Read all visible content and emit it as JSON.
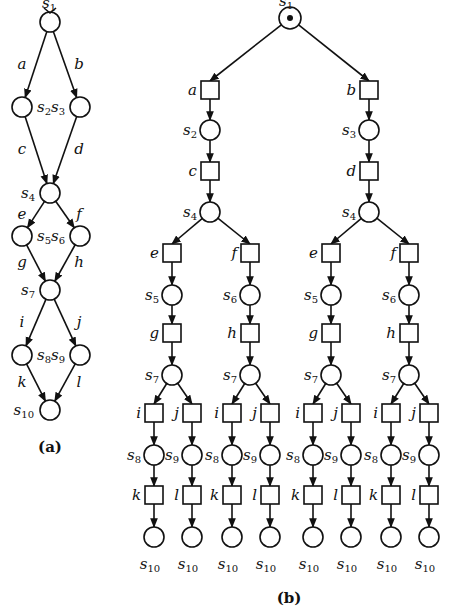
{
  "figure_a": {
    "caption": "(a)",
    "states": [
      {
        "id": "s1",
        "name": "s",
        "sub": "1",
        "x": 50,
        "y": 22
      },
      {
        "id": "s2",
        "name": "s",
        "sub": "2",
        "x": 22,
        "y": 107
      },
      {
        "id": "s3",
        "name": "s",
        "sub": "3",
        "x": 80,
        "y": 107
      },
      {
        "id": "s4",
        "name": "s",
        "sub": "4",
        "x": 50,
        "y": 193
      },
      {
        "id": "s5",
        "name": "s",
        "sub": "5",
        "x": 22,
        "y": 236
      },
      {
        "id": "s6",
        "name": "s",
        "sub": "6",
        "x": 80,
        "y": 236
      },
      {
        "id": "s7",
        "name": "s",
        "sub": "7",
        "x": 50,
        "y": 290
      },
      {
        "id": "s8",
        "name": "s",
        "sub": "8",
        "x": 22,
        "y": 355
      },
      {
        "id": "s9",
        "name": "s",
        "sub": "9",
        "x": 80,
        "y": 355
      },
      {
        "id": "s10",
        "name": "s",
        "sub": "10",
        "x": 50,
        "y": 410
      }
    ],
    "transitions": [
      {
        "label": "a",
        "from": "s1",
        "to": "s2"
      },
      {
        "label": "b",
        "from": "s1",
        "to": "s3"
      },
      {
        "label": "c",
        "from": "s2",
        "to": "s4"
      },
      {
        "label": "d",
        "from": "s3",
        "to": "s4"
      },
      {
        "label": "e",
        "from": "s4",
        "to": "s5"
      },
      {
        "label": "f",
        "from": "s4",
        "to": "s6"
      },
      {
        "label": "g",
        "from": "s5",
        "to": "s7"
      },
      {
        "label": "h",
        "from": "s6",
        "to": "s7"
      },
      {
        "label": "i",
        "from": "s7",
        "to": "s8"
      },
      {
        "label": "j",
        "from": "s7",
        "to": "s9"
      },
      {
        "label": "k",
        "from": "s8",
        "to": "s10"
      },
      {
        "label": "l",
        "from": "s9",
        "to": "s10"
      }
    ]
  },
  "figure_b": {
    "caption": "(b)",
    "root": {
      "name": "s",
      "sub": "1",
      "marked": true
    },
    "description": "Unfolding of the transition system (a) into an occurrence net tree: circles are places (states), squares are events (transitions); root place s1 carries a token.",
    "leaf_label": {
      "name": "s",
      "sub": "10"
    },
    "branch_count": 8
  }
}
